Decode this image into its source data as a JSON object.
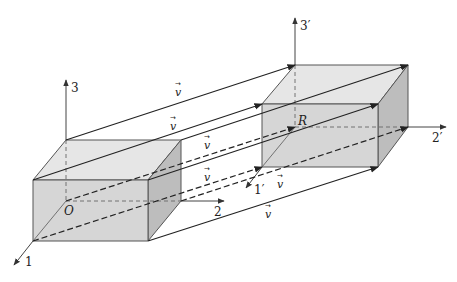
{
  "diagram": {
    "colors": {
      "face_front": "#d6d6d6",
      "face_top": "#e6e6e6",
      "face_side": "#bdbdbd",
      "edge": "#555555",
      "vector": "#222222"
    },
    "origin_label": "O",
    "translated_origin_label": "R",
    "axes_original": {
      "x1": "1",
      "x2": "2",
      "x3": "3"
    },
    "axes_translated": {
      "x1": "1′",
      "x2": "2′",
      "x3": "3′"
    },
    "vector_symbol": "v",
    "vector_arrow": "→",
    "vector_labels": [
      "v",
      "v",
      "v",
      "v",
      "v",
      "v"
    ]
  }
}
